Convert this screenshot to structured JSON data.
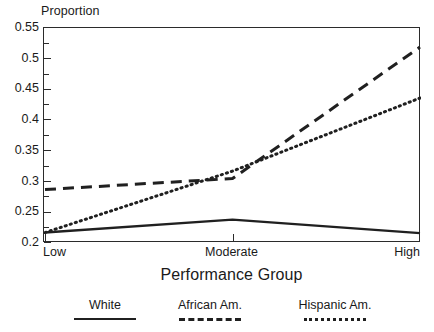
{
  "chart_data": {
    "type": "line",
    "title": "",
    "xlabel": "Performance Group",
    "ylabel": "Proportion",
    "categories": [
      "Low",
      "Moderate",
      "High"
    ],
    "xtick_labels": [
      "Low",
      "Moderate",
      "High"
    ],
    "ytick_labels": [
      "0.2",
      "0.25",
      "0.3",
      "0.35",
      "0.4",
      "0.45",
      "0.5",
      "0.55"
    ],
    "ytick_values": [
      0.2,
      0.25,
      0.3,
      0.35,
      0.4,
      0.45,
      0.5,
      0.55
    ],
    "yminor_values": [
      0.225,
      0.275,
      0.325,
      0.375,
      0.425,
      0.475,
      0.525
    ],
    "ylim": [
      0.2,
      0.55
    ],
    "xlim": [
      0,
      2
    ],
    "grid": false,
    "legend_position": "below",
    "series": [
      {
        "name": "White",
        "style": "solid",
        "color": "#202020",
        "values": [
          0.217,
          0.238,
          0.216
        ]
      },
      {
        "name": "African Am.",
        "style": "dashed",
        "color": "#202020",
        "values": [
          0.287,
          0.305,
          0.519
        ]
      },
      {
        "name": "Hispanic Am.",
        "style": "dotted",
        "color": "#202020",
        "values": [
          0.217,
          0.317,
          0.436
        ]
      }
    ]
  },
  "axes": {
    "y_title": "Proportion",
    "x_title": "Performance Group",
    "y_labels": [
      "0.55",
      "0.5",
      "0.45",
      "0.4",
      "0.35",
      "0.3",
      "0.25",
      "0.2"
    ],
    "x_labels": [
      "Low",
      "Moderate",
      "High"
    ]
  },
  "legend": {
    "items": [
      {
        "label": "White",
        "style": "solid"
      },
      {
        "label": "African Am.",
        "style": "dashed"
      },
      {
        "label": "Hispanic Am.",
        "style": "dotted"
      }
    ]
  },
  "colors": {
    "line": "#202020",
    "axis": "#2b2b2b",
    "text": "#1a1a1a",
    "background": "#ffffff"
  }
}
